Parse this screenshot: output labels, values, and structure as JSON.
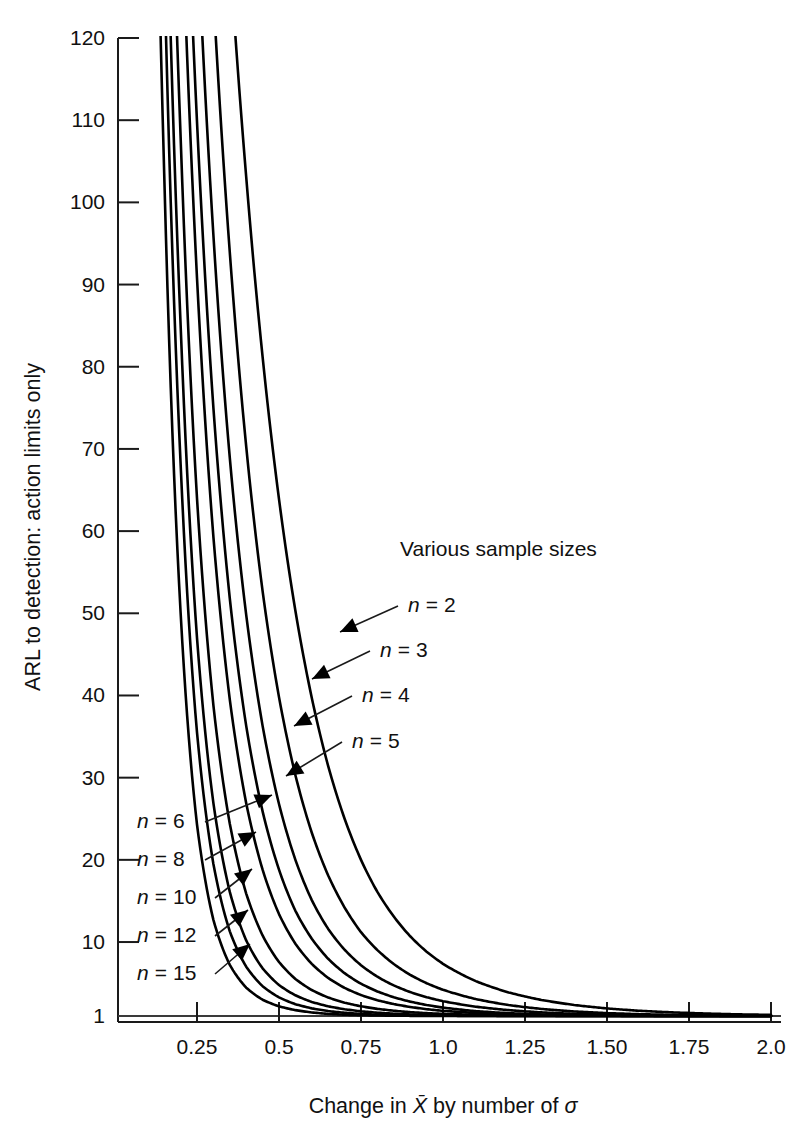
{
  "figure": {
    "background_color": "#ffffff",
    "line_color": "#000000"
  },
  "annotations": {
    "group_title": "Various sample sizes",
    "right_labels": [
      {
        "name": "n-2",
        "text": "n = 2",
        "x": 408,
        "y": 612,
        "arrow_from_x": 398,
        "arrow_from_y": 606,
        "arrow_to_x": 340,
        "arrow_to_y": 632
      },
      {
        "name": "n-3",
        "text": "n = 3",
        "x": 380,
        "y": 657,
        "arrow_from_x": 370,
        "arrow_from_y": 651,
        "arrow_to_x": 312,
        "arrow_to_y": 679
      },
      {
        "name": "n-4",
        "text": "n = 4",
        "x": 362,
        "y": 702,
        "arrow_from_x": 352,
        "arrow_from_y": 696,
        "arrow_to_x": 294,
        "arrow_to_y": 726
      },
      {
        "name": "n-5",
        "text": "n = 5",
        "x": 352,
        "y": 748,
        "arrow_from_x": 342,
        "arrow_from_y": 742,
        "arrow_to_x": 286,
        "arrow_to_y": 776
      }
    ],
    "left_labels": [
      {
        "name": "n-6",
        "text": "n = 6",
        "x": 137,
        "y": 828,
        "arrow_from_x": 205,
        "arrow_from_y": 822,
        "arrow_to_x": 272,
        "arrow_to_y": 795
      },
      {
        "name": "n-8",
        "text": "n = 8",
        "x": 137,
        "y": 866,
        "arrow_from_x": 205,
        "arrow_from_y": 860,
        "arrow_to_x": 256,
        "arrow_to_y": 832
      },
      {
        "name": "n-10",
        "text": "n = 10",
        "x": 137,
        "y": 904,
        "arrow_from_x": 215,
        "arrow_from_y": 898,
        "arrow_to_x": 252,
        "arrow_to_y": 869
      },
      {
        "name": "n-12",
        "text": "n = 12",
        "x": 137,
        "y": 942,
        "arrow_from_x": 215,
        "arrow_from_y": 936,
        "arrow_to_x": 248,
        "arrow_to_y": 910
      },
      {
        "name": "n-15",
        "text": "n = 15",
        "x": 137,
        "y": 980,
        "arrow_from_x": 215,
        "arrow_from_y": 974,
        "arrow_to_x": 250,
        "arrow_to_y": 944
      }
    ]
  },
  "chart_data": {
    "type": "line",
    "title": "",
    "subtitle": "",
    "xlabel": "Change in X̄ by number of σ",
    "ylabel": "ARL to detection: action limits only",
    "xlim": [
      0,
      2.0
    ],
    "ylim": [
      1,
      120
    ],
    "grid": false,
    "legend_position": "inline-annotations",
    "annotation": "Various sample sizes",
    "xticks": [
      0.25,
      0.5,
      0.75,
      1.0,
      1.25,
      1.5,
      1.75,
      2.0
    ],
    "xticklabels": [
      "0.25",
      "0.5",
      "0.75",
      "1.0",
      "1.25",
      "1.50",
      "1.75",
      "2.0"
    ],
    "yticks": [
      1,
      10,
      20,
      30,
      40,
      50,
      60,
      70,
      80,
      90,
      100,
      110,
      120
    ],
    "yticklabels": [
      "1",
      "10",
      "20",
      "30",
      "40",
      "50",
      "60",
      "70",
      "80",
      "90",
      "100",
      "110",
      "120"
    ],
    "x": [
      0.1,
      0.15,
      0.2,
      0.25,
      0.3,
      0.35,
      0.4,
      0.45,
      0.5,
      0.55,
      0.6,
      0.65,
      0.7,
      0.75,
      0.8,
      0.85,
      0.9,
      0.95,
      1.0,
      1.1,
      1.2,
      1.3,
      1.4,
      1.5,
      1.6,
      1.7,
      1.8,
      1.9,
      2.0
    ],
    "series": [
      {
        "name": "n = 2",
        "n": 2,
        "values": [
          328.5,
          288.4,
          244.7,
          201.8,
          163.1,
          130.2,
          103.1,
          81.2,
          63.9,
          50.3,
          39.7,
          31.4,
          25.0,
          20.0,
          16.1,
          13.1,
          10.7,
          8.83,
          7.35,
          5.24,
          3.87,
          2.95,
          2.34,
          1.92,
          1.63,
          1.44,
          1.3,
          1.2,
          1.14
        ]
      },
      {
        "name": "n = 3",
        "n": 3,
        "values": [
          318.6,
          266.6,
          213.4,
          165.1,
          125.2,
          93.9,
          70.3,
          52.7,
          39.8,
          30.3,
          23.3,
          18.1,
          14.2,
          11.2,
          9.02,
          7.32,
          6.01,
          4.99,
          4.19,
          3.06,
          2.33,
          1.86,
          1.55,
          1.35,
          1.22,
          1.14,
          1.09,
          1.05,
          1.03
        ]
      },
      {
        "name": "n = 4",
        "n": 4,
        "values": [
          308.5,
          245.7,
          185.0,
          133.9,
          96.0,
          68.9,
          49.8,
          36.3,
          26.8,
          20.0,
          15.1,
          11.6,
          9.06,
          7.18,
          5.78,
          4.72,
          3.91,
          3.29,
          2.8,
          2.13,
          1.71,
          1.44,
          1.26,
          1.16,
          1.09,
          1.05,
          1.03,
          1.01,
          1.01
        ]
      },
      {
        "name": "n = 5",
        "n": 5,
        "values": [
          298.4,
          226.5,
          160.6,
          109.8,
          75.0,
          51.8,
          36.3,
          25.9,
          18.8,
          13.8,
          10.4,
          7.96,
          6.21,
          4.93,
          3.99,
          3.28,
          2.75,
          2.34,
          2.02,
          1.59,
          1.34,
          1.19,
          1.1,
          1.06,
          1.03,
          1.01,
          1.0,
          1.0,
          1.0
        ]
      },
      {
        "name": "n = 6",
        "n": 6,
        "values": [
          288.3,
          208.8,
          139.9,
          90.8,
          59.3,
          39.5,
          26.9,
          18.8,
          13.4,
          9.8,
          7.34,
          5.63,
          4.42,
          3.55,
          2.92,
          2.45,
          2.1,
          1.83,
          1.63,
          1.36,
          1.2,
          1.11,
          1.06,
          1.03,
          1.01,
          1.0,
          1.0,
          1.0,
          1.0
        ]
      },
      {
        "name": "n = 8",
        "n": 8,
        "values": [
          268.5,
          176.8,
          108.0,
          64.0,
          38.8,
          24.4,
          15.9,
          10.8,
          7.57,
          5.51,
          4.16,
          3.25,
          2.62,
          2.18,
          1.87,
          1.64,
          1.47,
          1.35,
          1.26,
          1.14,
          1.07,
          1.03,
          1.01,
          1.01,
          1.0,
          1.0,
          1.0,
          1.0,
          1.0
        ]
      },
      {
        "name": "n = 10",
        "n": 10,
        "values": [
          249.4,
          150.6,
          85.1,
          47.0,
          26.9,
          16.1,
          10.2,
          6.8,
          4.77,
          3.52,
          2.71,
          2.18,
          1.82,
          1.57,
          1.4,
          1.28,
          1.19,
          1.13,
          1.09,
          1.04,
          1.01,
          1.0,
          1.0,
          1.0,
          1.0,
          1.0,
          1.0,
          1.0,
          1.0
        ]
      },
      {
        "name": "n = 12",
        "n": 12,
        "values": [
          231.0,
          128.9,
          68.2,
          35.5,
          19.5,
          11.3,
          7.0,
          4.63,
          3.26,
          2.44,
          1.93,
          1.6,
          1.39,
          1.25,
          1.16,
          1.1,
          1.07,
          1.04,
          1.03,
          1.01,
          1.0,
          1.0,
          1.0,
          1.0,
          1.0,
          1.0,
          1.0,
          1.0,
          1.0
        ]
      },
      {
        "name": "n = 15",
        "n": 15,
        "values": [
          205.4,
          103.5,
          50.1,
          24.3,
          12.7,
          7.22,
          4.45,
          2.98,
          2.17,
          1.71,
          1.43,
          1.26,
          1.16,
          1.1,
          1.06,
          1.04,
          1.02,
          1.01,
          1.01,
          1.0,
          1.0,
          1.0,
          1.0,
          1.0,
          1.0,
          1.0,
          1.0,
          1.0,
          1.0
        ]
      }
    ]
  }
}
